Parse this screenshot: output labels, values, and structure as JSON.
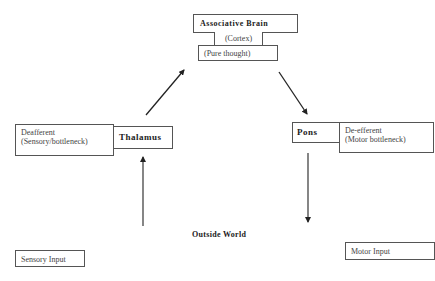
{
  "diagram": {
    "top_cluster": {
      "associative_brain": "Associative Brain",
      "cortex": "(Cortex)",
      "pure_thought": "(Pure  thought)"
    },
    "left_node": {
      "deafferent_line1": "Deafferent",
      "deafferent_line2": "(Sensory/bottleneck)",
      "thalamus": "Thalamus"
    },
    "right_node": {
      "pons": "Pons",
      "deefferent_line1": "De-efferent",
      "deefferent_line2": "(Motor bottleneck)"
    },
    "outside_world": "Outside World",
    "sensory_input": "Sensory Input",
    "motor_input": "Motor Input",
    "edges": [
      {
        "from": "Thalamus",
        "to": "Associative Brain",
        "direction": "up-right"
      },
      {
        "from": "Associative Brain",
        "to": "Pons",
        "direction": "down-right"
      },
      {
        "from": "Outside World",
        "to": "Thalamus",
        "direction": "up"
      },
      {
        "from": "Pons",
        "to": "Outside World",
        "direction": "down"
      }
    ],
    "colors": {
      "line": "#222222",
      "border": "#555555",
      "text": "#333333",
      "background": "#ffffff"
    }
  }
}
